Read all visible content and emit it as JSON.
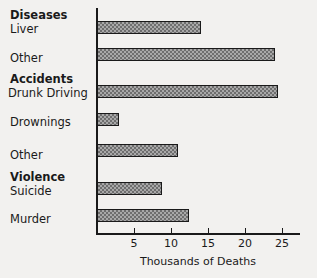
{
  "chart_data": {
    "type": "bar",
    "orientation": "horizontal",
    "title": "",
    "xlabel": "Thousands of Deaths",
    "ylabel": "",
    "xlim": [
      0,
      27.5
    ],
    "xticks": [
      5,
      10,
      15,
      20,
      25
    ],
    "xtick_labels": [
      "5",
      "10",
      "15",
      "20",
      "25"
    ],
    "grid": false,
    "legend": null,
    "groups": [
      {
        "name": "Diseases",
        "items": [
          {
            "label": "Liver",
            "value": 14.0
          },
          {
            "label": "Other",
            "value": 24.0
          }
        ]
      },
      {
        "name": "Accidents",
        "items": [
          {
            "label": "Drunk Driving",
            "value": 24.5
          },
          {
            "label": "Drownings",
            "value": 3.0
          },
          {
            "label": "Other",
            "value": 10.9
          }
        ]
      },
      {
        "name": "Violence",
        "items": [
          {
            "label": "Suicide",
            "value": 8.8
          },
          {
            "label": "Murder",
            "value": 12.4
          }
        ]
      }
    ],
    "categories": [
      "Liver",
      "Other",
      "Drunk Driving",
      "Drownings",
      "Other",
      "Suicide",
      "Murder"
    ],
    "values": [
      14.0,
      24.0,
      24.5,
      3.0,
      10.9,
      8.8,
      12.4
    ],
    "colors": {
      "bar_fill": "#a8a8a8",
      "bar_hatch": "#6e6e6e",
      "bar_edge": "#1a1a1a",
      "axis": "#1a1a1a",
      "background": "#f2f1ef",
      "text": "#1a1a1a"
    }
  },
  "labels": {
    "group_diseases": "Diseases",
    "group_accidents": "Accidents",
    "group_violence": "Violence",
    "liver": "Liver",
    "diseases_other": "Other",
    "drunk_driving": "Drunk Driving",
    "drownings": "Drownings",
    "accidents_other": "Other",
    "suicide": "Suicide",
    "murder": "Murder",
    "axis_title": "Thousands of Deaths",
    "tick_5": "5",
    "tick_10": "10",
    "tick_15": "15",
    "tick_20": "20",
    "tick_25": "25"
  }
}
